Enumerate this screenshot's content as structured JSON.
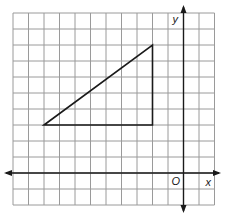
{
  "diagram": {
    "type": "coordinate-grid",
    "grid": {
      "columns": 13,
      "rows": 12,
      "left": 13,
      "top": 13,
      "cell_width": 15.5,
      "cell_height": 16,
      "line_color": "#9a9a9a"
    },
    "axes": {
      "x_label": "x",
      "y_label": "y",
      "origin_label": "O",
      "origin_col": 11,
      "origin_row": 10,
      "color": "#1a1a1a"
    },
    "shape": {
      "name": "right triangle",
      "vertices": [
        [
          -9,
          3
        ],
        [
          -2,
          8
        ],
        [
          -2,
          3
        ]
      ],
      "stroke": "#1a1a1a"
    }
  }
}
